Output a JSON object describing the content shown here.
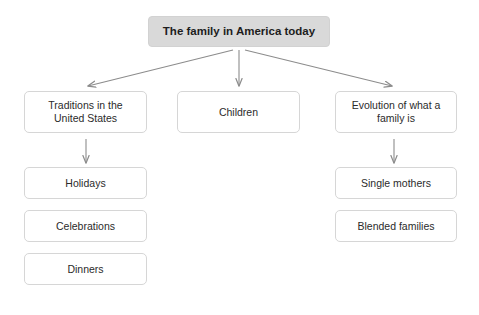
{
  "diagram": {
    "type": "hierarchy-tree",
    "title_node": {
      "label": "The family in America today",
      "fill_color": "#d9d9d9",
      "text_color": "#1d1d1d",
      "x": 148,
      "y": 16,
      "w": 182,
      "h": 31
    },
    "level2": [
      {
        "id": "traditions",
        "label": "Traditions in the\nUnited States",
        "x": 24,
        "y": 91,
        "w": 123,
        "h": 42
      },
      {
        "id": "children",
        "label": "Children",
        "x": 177,
        "y": 91,
        "w": 123,
        "h": 42
      },
      {
        "id": "evolution",
        "label": "Evolution of what a\nfamily is",
        "x": 335,
        "y": 91,
        "w": 122,
        "h": 42
      }
    ],
    "level3_left": [
      {
        "id": "holidays",
        "label": "Holidays",
        "x": 24,
        "y": 167,
        "w": 123,
        "h": 32
      },
      {
        "id": "celebrations",
        "label": "Celebrations",
        "x": 24,
        "y": 210,
        "w": 123,
        "h": 32
      },
      {
        "id": "dinners",
        "label": "Dinners",
        "x": 24,
        "y": 253,
        "w": 123,
        "h": 32
      }
    ],
    "level3_right": [
      {
        "id": "single-mothers",
        "label": "Single mothers",
        "x": 335,
        "y": 167,
        "w": 122,
        "h": 32
      },
      {
        "id": "blended-families",
        "label": "Blended families",
        "x": 335,
        "y": 210,
        "w": 122,
        "h": 32
      }
    ],
    "connectors": {
      "stroke_color": "#8c8c8c",
      "stroke_width": 1.1,
      "arrows": [
        {
          "name": "arrow-root-to-traditions",
          "x1": 233,
          "y1": 50,
          "x2": 88,
          "y2": 86
        },
        {
          "name": "arrow-root-to-children",
          "x1": 239,
          "y1": 50,
          "x2": 239,
          "y2": 86
        },
        {
          "name": "arrow-root-to-evolution",
          "x1": 245,
          "y1": 50,
          "x2": 392,
          "y2": 86
        },
        {
          "name": "arrow-traditions-to-holidays",
          "x1": 86,
          "y1": 138,
          "x2": 86,
          "y2": 163
        },
        {
          "name": "arrow-evolution-to-single-mothers",
          "x1": 394,
          "y1": 138,
          "x2": 394,
          "y2": 163
        }
      ]
    }
  }
}
